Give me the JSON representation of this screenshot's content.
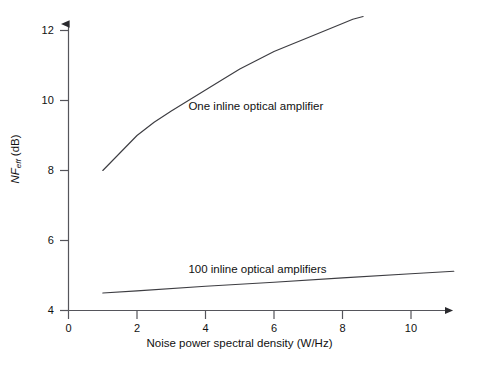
{
  "chart_data": {
    "type": "line",
    "title": "",
    "subtitle": "",
    "xlabel": "Noise power spectral density (W/Hz)",
    "ylabel": "NFeff (dB)",
    "ylabel_parts": {
      "base": "NF",
      "sub": "eff",
      "units": "(dB)"
    },
    "xlim": [
      0,
      11.6
    ],
    "ylim": [
      4,
      12.6
    ],
    "xticks": [
      0,
      2,
      4,
      6,
      8,
      10
    ],
    "yticks": [
      4,
      6,
      8,
      10,
      12
    ],
    "xticklabels": [
      "0",
      "2",
      "4",
      "6",
      "8",
      "10"
    ],
    "yticklabels": [
      "4",
      "6",
      "8",
      "10",
      "12"
    ],
    "grid": false,
    "legend": "inline-annotations",
    "axis_arrows": true,
    "line_color": "#3d3d42",
    "axis_color": "#4a4a50",
    "background": "#ffffff",
    "series": [
      {
        "name": "One inline optical amplifier",
        "label_x": 3.5,
        "label_y": 9.85,
        "x": [
          1.0,
          1.5,
          2.0,
          2.5,
          3.0,
          3.5,
          4.0,
          4.5,
          5.0,
          5.5,
          6.0,
          6.5,
          7.0,
          7.5,
          8.0,
          8.3,
          8.6
        ],
        "y": [
          8.0,
          8.5,
          9.0,
          9.38,
          9.7,
          10.0,
          10.3,
          10.6,
          10.9,
          11.15,
          11.4,
          11.6,
          11.8,
          12.0,
          12.2,
          12.32,
          12.4
        ]
      },
      {
        "name": "100 inline optical amplifiers",
        "label_x": 3.5,
        "label_y": 5.2,
        "x": [
          1.0,
          2.0,
          4.0,
          6.0,
          8.0,
          10.0,
          11.25
        ],
        "y": [
          4.5,
          4.56,
          4.69,
          4.81,
          4.93,
          5.05,
          5.12
        ]
      }
    ]
  }
}
